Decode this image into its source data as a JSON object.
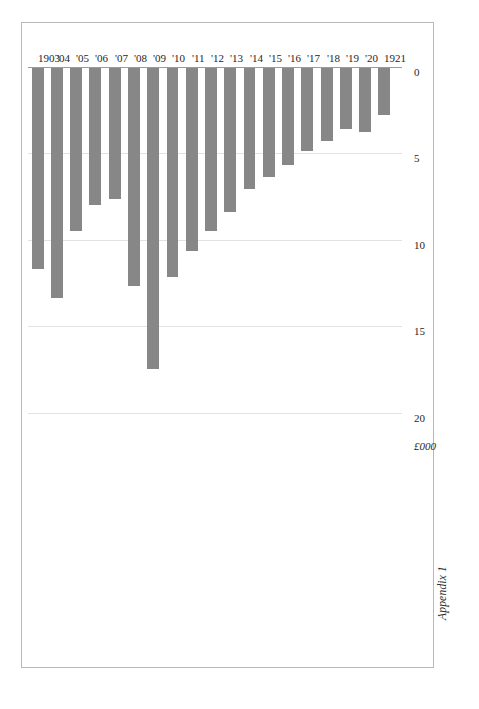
{
  "caption": "Appendix 1",
  "chart_data": {
    "type": "bar",
    "orientation": "horizontal",
    "title": "",
    "subtitle": "",
    "xlabel": "£000",
    "ylabel": "",
    "unit_label": "£000",
    "xlim": [
      0,
      20
    ],
    "ticks": [
      "0",
      "5",
      "10",
      "15",
      "20"
    ],
    "tick_values": [
      0,
      5,
      10,
      15,
      20
    ],
    "grid": true,
    "legend": "none",
    "bar_color": "#878787",
    "gridline_color": "#e2e2e2",
    "axis_color": "#9a9a9a",
    "frame_color": "#b9b9b9",
    "categories": [
      "1903",
      "'04",
      "'05",
      "'06",
      "'07",
      "'08",
      "'09",
      "'10",
      "'11",
      "'12",
      "'13",
      "'14",
      "'15",
      "'16",
      "'17",
      "'18",
      "'19",
      "'20",
      "1921"
    ],
    "values": [
      11.6,
      13.3,
      9.4,
      7.9,
      7.6,
      12.6,
      17.4,
      12.1,
      10.6,
      9.4,
      8.3,
      7.0,
      6.3,
      5.6,
      4.8,
      4.2,
      3.5,
      3.7,
      2.7
    ]
  }
}
